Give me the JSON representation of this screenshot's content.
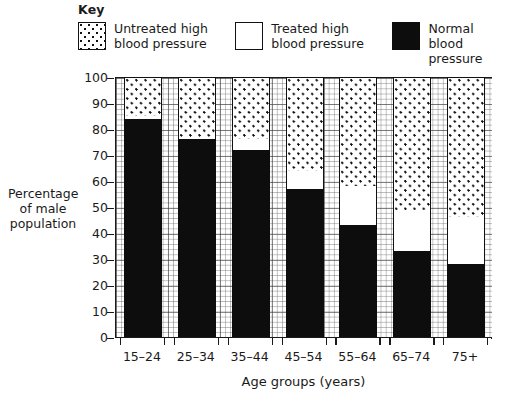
{
  "key": {
    "title": "Key",
    "items": [
      {
        "swatch": "dotted-swatch",
        "label_line1": "Untreated high",
        "label_line2": "blood pressure"
      },
      {
        "swatch": "white-swatch",
        "label_line1": "Treated high",
        "label_line2": "blood pressure"
      },
      {
        "swatch": "black-swatch",
        "label_line1": "Normal",
        "label_line2": "blood pressure"
      }
    ]
  },
  "chart_data": {
    "type": "bar",
    "stacked": true,
    "title": "",
    "xlabel": "Age groups (years)",
    "ylabel": "Percentage of male population",
    "ylabel_lines": [
      "Percentage",
      "of male",
      "population"
    ],
    "categories": [
      "15–24",
      "25–34",
      "35–44",
      "45–54",
      "55–64",
      "65–74",
      "75+"
    ],
    "ylim": [
      0,
      100
    ],
    "yticks": [
      0,
      10,
      20,
      30,
      40,
      50,
      60,
      70,
      80,
      90,
      100
    ],
    "ytick_labels": [
      "0",
      "10",
      "20",
      "30",
      "40",
      "50",
      "60",
      "70",
      "80",
      "90",
      "100"
    ],
    "grid": "graph-paper minor every 2 units, major every 10 units",
    "legend_position": "above-plot",
    "series": [
      {
        "name": "Normal blood pressure",
        "key": "normal",
        "color": "#0d0d0d",
        "values": [
          84,
          76,
          72,
          57,
          43,
          33,
          28
        ]
      },
      {
        "name": "Treated high blood pressure",
        "key": "treated",
        "color": "#ffffff",
        "values": [
          1,
          1,
          4,
          7,
          15,
          16,
          18
        ]
      },
      {
        "name": "Untreated high blood pressure",
        "key": "untreated",
        "color": "#ffffff-dotted",
        "values": [
          15,
          23,
          24,
          36,
          42,
          51,
          54
        ]
      }
    ],
    "segment_tops": {
      "normal": [
        84,
        76,
        72,
        57,
        43,
        33,
        28
      ],
      "treated": [
        85,
        77,
        76,
        64,
        58,
        49,
        46
      ],
      "untreated": [
        100,
        100,
        100,
        100,
        100,
        100,
        100
      ]
    }
  },
  "colors": {
    "ink": "#1a1a1a",
    "black_fill": "#0d0d0d",
    "white_fill": "#ffffff",
    "grid_major": "#5a5a5a",
    "grid_minor": "#8a8a8a"
  }
}
